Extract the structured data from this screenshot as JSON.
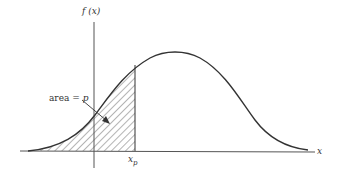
{
  "diagram": {
    "type": "probability-density-percentile",
    "y_axis_label": "f (x)",
    "x_axis_label": "x",
    "percentile_label": "x",
    "percentile_subscript": "p",
    "area_label_prefix": "area = ",
    "area_label_var": "p",
    "colors": {
      "line": "#333333",
      "hatch": "#444444",
      "background": "#ffffff"
    }
  }
}
